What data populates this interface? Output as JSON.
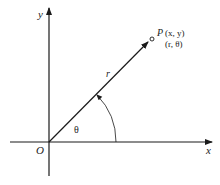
{
  "diagram": {
    "axes": {
      "x_label": "x",
      "y_label": "y",
      "origin_label": "O"
    },
    "point": {
      "name": "P",
      "cartesian": "(x, y)",
      "polar": "(r, θ)"
    },
    "ray_label": "r",
    "angle_label": "θ",
    "colors": {
      "stroke": "#1a1a1a",
      "background": "#ffffff"
    }
  }
}
